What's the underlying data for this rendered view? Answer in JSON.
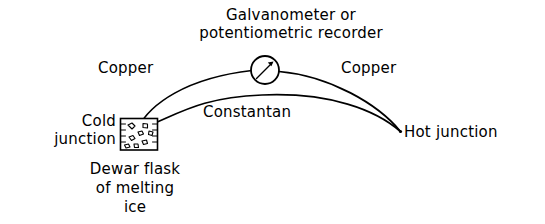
{
  "figure": {
    "kind": "thermocouple-circuit-diagram",
    "background_color": "#ffffff",
    "ink_color": "#000000",
    "title": "Galvanometer or\npotentiometric recorder",
    "title_lines": [
      "Galvanometer or",
      "potentiometric recorder"
    ],
    "labels": {
      "copper_left": "Copper",
      "copper_right": "Copper",
      "constantan": "Constantan",
      "cold_junction": "Cold\njunction",
      "cold_junction_lines": [
        "Cold",
        "junction"
      ],
      "hot_junction": "Hot junction",
      "dewar_caption": "Dewar flask\nof melting\nice",
      "dewar_caption_lines": [
        "Dewar flask",
        "of melting",
        "ice"
      ]
    },
    "icons": {
      "meter": "galvanometer-dial-icon",
      "flask": "dewar-flask-icon",
      "needle": "meter-needle-icon"
    },
    "elements": [
      "upper-arc-copper-wire",
      "lower-arc-constantan-wire",
      "galvanometer-meter",
      "dewar-flask-cold-junction",
      "hot-junction-point"
    ]
  }
}
